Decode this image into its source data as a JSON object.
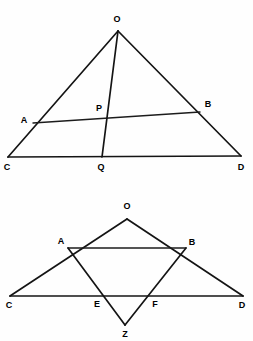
{
  "figure": {
    "background_color": "#fefefe",
    "line_color": "#141414",
    "label_color": "#000000"
  },
  "diagrams": [
    {
      "id": "top-diagram",
      "name": "triangle-ocd-with-cevian",
      "points": {
        "O": {
          "label": "O",
          "x": 118,
          "y": 31,
          "lx": 117,
          "ly": 19
        },
        "A": {
          "label": "A",
          "x": 33,
          "y": 123,
          "lx": 24,
          "ly": 120
        },
        "B": {
          "label": "B",
          "x": 200,
          "y": 112,
          "lx": 208,
          "ly": 104
        },
        "C": {
          "label": "C",
          "x": 8,
          "y": 157,
          "lx": 7,
          "ly": 167
        },
        "D": {
          "label": "D",
          "x": 241,
          "y": 156,
          "lx": 241,
          "ly": 167
        },
        "P": {
          "label": "P",
          "x": 104,
          "y": 117,
          "lx": 99,
          "ly": 108
        },
        "Q": {
          "label": "Q",
          "x": 102,
          "y": 157,
          "lx": 101,
          "ly": 167
        }
      },
      "segments": [
        {
          "name": "side-OC",
          "from": "O",
          "to": "C"
        },
        {
          "name": "side-OD",
          "from": "O",
          "to": "D"
        },
        {
          "name": "base-CD",
          "from": "C",
          "to": "D"
        },
        {
          "name": "chord-AB",
          "from": "A",
          "to": "B"
        },
        {
          "name": "cevian-OQ",
          "from": "O",
          "to": "Q"
        }
      ]
    },
    {
      "id": "bottom-diagram",
      "name": "triangle-ocd-with-rhombus-and-z",
      "points": {
        "O": {
          "label": "O",
          "x": 127,
          "y": 219,
          "lx": 127,
          "ly": 206
        },
        "A": {
          "label": "A",
          "x": 68,
          "y": 248,
          "lx": 61,
          "ly": 241
        },
        "B": {
          "label": "B",
          "x": 186,
          "y": 248,
          "lx": 192,
          "ly": 242
        },
        "C": {
          "label": "C",
          "x": 10,
          "y": 296,
          "lx": 9,
          "ly": 305
        },
        "D": {
          "label": "D",
          "x": 243,
          "y": 296,
          "lx": 242,
          "ly": 305
        },
        "E": {
          "label": "E",
          "x": 104,
          "y": 297,
          "lx": 97,
          "ly": 304
        },
        "F": {
          "label": "F",
          "x": 148,
          "y": 297,
          "lx": 155,
          "ly": 304
        },
        "Z": {
          "label": "Z",
          "x": 125,
          "y": 325,
          "lx": 125,
          "ly": 334
        }
      },
      "segments": [
        {
          "name": "side-OC",
          "from": "O",
          "to": "C"
        },
        {
          "name": "side-OD",
          "from": "O",
          "to": "D"
        },
        {
          "name": "base-CD",
          "from": "C",
          "to": "D"
        },
        {
          "name": "chord-AB",
          "from": "A",
          "to": "B"
        },
        {
          "name": "segment-AZ",
          "from": "A",
          "to": "Z"
        },
        {
          "name": "segment-BZ",
          "from": "B",
          "to": "Z"
        }
      ]
    }
  ]
}
